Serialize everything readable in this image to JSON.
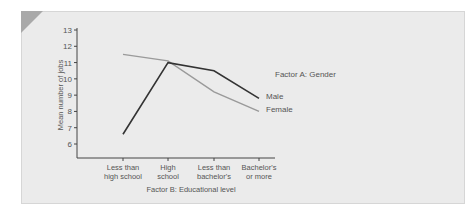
{
  "chart_data": {
    "type": "line",
    "title": "",
    "xlabel": "Factor B: Educational level",
    "ylabel": "Mean number of jobs",
    "ylim": [
      5,
      13
    ],
    "yticks": [
      6,
      7,
      8,
      9,
      10,
      11,
      12,
      13
    ],
    "categories": [
      [
        "Less than",
        "high school"
      ],
      [
        "High",
        "school"
      ],
      [
        "Less than",
        "bachelor's"
      ],
      [
        "Bachelor's",
        "or more"
      ]
    ],
    "legend_title": "Factor A: Gender",
    "series": [
      {
        "name": "Male",
        "color": "#333333",
        "values": [
          6.6,
          11.0,
          10.5,
          8.8
        ]
      },
      {
        "name": "Female",
        "color": "#9a9a9a",
        "values": [
          11.5,
          11.1,
          9.2,
          8.0
        ]
      }
    ],
    "grid": false
  },
  "colors": {
    "card_bg": "#ebebeb",
    "corner_accent": "#a9a9a9",
    "axis": "#444444"
  }
}
